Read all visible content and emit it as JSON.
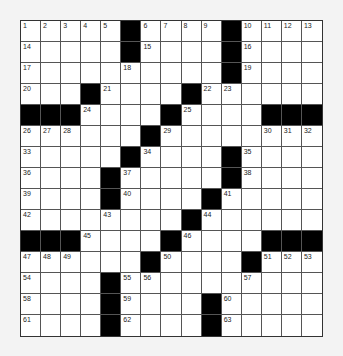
{
  "puzzle": {
    "rows": 15,
    "cols": 15,
    "colors": {
      "black": "#000000",
      "white": "#ffffff",
      "background": "#f3f3f3"
    },
    "grid": [
      [
        "1",
        "2",
        "3",
        "4",
        "5",
        "#",
        "6",
        "7",
        "8",
        "9",
        "#",
        "10",
        "11",
        "12",
        "13"
      ],
      [
        "14",
        "",
        "",
        "",
        "",
        "#",
        "15",
        "",
        "",
        "",
        "#",
        "16",
        "",
        "",
        ""
      ],
      [
        "17",
        "",
        "",
        "",
        "",
        "18",
        "",
        "",
        "",
        "",
        "#",
        "19",
        "",
        "",
        ""
      ],
      [
        "20",
        "",
        "",
        "#",
        "21",
        "",
        "",
        "",
        "#",
        "22",
        "23",
        "",
        "",
        "",
        ""
      ],
      [
        "#",
        "#",
        "#",
        "24",
        "",
        "",
        "",
        "#",
        "25",
        "",
        "",
        "",
        "#",
        "#",
        "#"
      ],
      [
        "26",
        "27",
        "28",
        "",
        "",
        "",
        "#",
        "29",
        "",
        "",
        "",
        "",
        "30",
        "31",
        "32"
      ],
      [
        "33",
        "",
        "",
        "",
        "",
        "#",
        "34",
        "",
        "",
        "",
        "#",
        "35",
        "",
        "",
        ""
      ],
      [
        "36",
        "",
        "",
        "",
        "#",
        "37",
        "",
        "",
        "",
        "",
        "#",
        "38",
        "",
        "",
        ""
      ],
      [
        "39",
        "",
        "",
        "",
        "#",
        "40",
        "",
        "",
        "",
        "#",
        "41",
        "",
        "",
        "",
        ""
      ],
      [
        "42",
        "",
        "",
        "",
        "43",
        "",
        "",
        "",
        "#",
        "44",
        "",
        "",
        "",
        "",
        ""
      ],
      [
        "#",
        "#",
        "#",
        "45",
        "",
        "",
        "",
        "#",
        "46",
        "",
        "",
        "",
        "#",
        "#",
        "#"
      ],
      [
        "47",
        "48",
        "49",
        "",
        "",
        "",
        "#",
        "50",
        "",
        "",
        "",
        "#",
        "51",
        "52",
        "53"
      ],
      [
        "54",
        "",
        "",
        "",
        "#",
        "55",
        "56",
        "",
        "",
        "",
        "",
        "57",
        "",
        "",
        ""
      ],
      [
        "58",
        "",
        "",
        "",
        "#",
        "59",
        "",
        "",
        "",
        "#",
        "60",
        "",
        "",
        "",
        ""
      ],
      [
        "61",
        "",
        "",
        "",
        "#",
        "62",
        "",
        "",
        "",
        "#",
        "63",
        "",
        "",
        "",
        ""
      ]
    ]
  }
}
